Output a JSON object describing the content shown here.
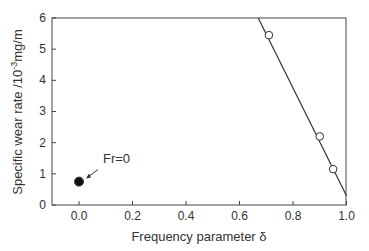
{
  "chart_data": {
    "type": "scatter",
    "title": "",
    "xlabel": "Frequency parameter δ",
    "ylabel": "Specific wear rate /10⁻³mg/m",
    "ylabel_parts": {
      "main": "Specific wear rate /10",
      "sup": "-3",
      "unit": "mg/m"
    },
    "xlim": [
      -0.1,
      1.0
    ],
    "ylim": [
      0,
      6
    ],
    "grid": false,
    "x_ticks": [
      "0.0",
      "0.2",
      "0.4",
      "0.6",
      "0.8",
      "1.0"
    ],
    "y_ticks": [
      "0",
      "1",
      "2",
      "3",
      "4",
      "5",
      "6"
    ],
    "series": [
      {
        "name": "open-circles",
        "marker": "open-circle",
        "x": [
          0.71,
          0.9,
          0.95
        ],
        "y": [
          5.45,
          2.2,
          1.15
        ]
      },
      {
        "name": "Fr=0",
        "marker": "filled-circle",
        "x": [
          0.0
        ],
        "y": [
          0.75
        ]
      }
    ],
    "fit_line": {
      "x": [
        0.67,
        1.0
      ],
      "y": [
        6.0,
        0.3
      ]
    },
    "annotations": [
      {
        "text": "Fr=0",
        "points_to": [
          0.0,
          0.75
        ]
      }
    ]
  }
}
